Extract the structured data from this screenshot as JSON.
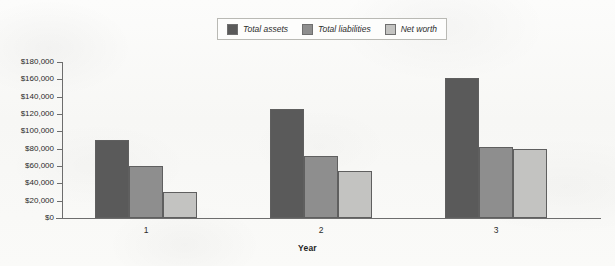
{
  "chart_data": {
    "type": "bar",
    "title": "",
    "subtitle": "",
    "xlabel": "Year",
    "ylabel": "",
    "categories": [
      "1",
      "2",
      "3"
    ],
    "series": [
      {
        "name": "Total assets",
        "color": "#5a5a5a",
        "values": [
          90000,
          126000,
          162000
        ]
      },
      {
        "name": "Total liabilities",
        "color": "#8e8e8e",
        "values": [
          60000,
          71000,
          82000
        ]
      },
      {
        "name": "Net worth",
        "color": "#c3c3c1",
        "values": [
          30000,
          54000,
          80000
        ]
      }
    ],
    "ylim": [
      0,
      180000
    ],
    "ytick_step": 20000,
    "ytick_labels": [
      "$180,000",
      "$160,000",
      "$140,000",
      "$120,000",
      "$100,000",
      "$80,000",
      "$60,000",
      "$40,000",
      "$20,000",
      "$0"
    ],
    "ytick_values": [
      180000,
      160000,
      140000,
      120000,
      100000,
      80000,
      60000,
      40000,
      20000,
      0
    ],
    "grid": false,
    "legend_position": "top-center",
    "orientation": "vertical",
    "grouping": "clustered"
  },
  "legend": {
    "entries": [
      {
        "label": "Total assets",
        "color": "#5a5a5a"
      },
      {
        "label": "Total liabilities",
        "color": "#8e8e8e"
      },
      {
        "label": "Net worth",
        "color": "#c3c3c1"
      }
    ]
  },
  "axes": {
    "x_title": "Year",
    "x_categories": [
      "1",
      "2",
      "3"
    ],
    "y_labels": [
      "$180,000",
      "$160,000",
      "$140,000",
      "$120,000",
      "$100,000",
      "$80,000",
      "$60,000",
      "$40,000",
      "$20,000",
      "$0"
    ]
  }
}
